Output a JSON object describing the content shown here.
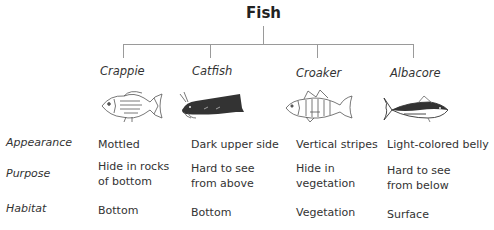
{
  "title": "Fish",
  "species": [
    {
      "name": "Crappie",
      "icon": "crappie-fish-icon"
    },
    {
      "name": "Catfish",
      "icon": "catfish-icon"
    },
    {
      "name": "Croaker",
      "icon": "croaker-fish-icon"
    },
    {
      "name": "Albacore",
      "icon": "albacore-fish-icon"
    }
  ],
  "rows": [
    {
      "label": "Appearance",
      "values": [
        "Mottled",
        "Dark upper side",
        "Vertical stripes",
        "Light-colored belly"
      ]
    },
    {
      "label": "Purpose",
      "values": [
        [
          "Hide in rocks",
          "of bottom"
        ],
        [
          "Hard to see",
          "from above"
        ],
        [
          "Hide in",
          "vegetation"
        ],
        [
          "Hard to see",
          "from below"
        ]
      ]
    },
    {
      "label": "Habitat",
      "values": [
        "Bottom",
        "Bottom",
        "Vegetation",
        "Surface"
      ]
    }
  ],
  "purpose_lines": {
    "c0": {
      "l1": "Hide in rocks",
      "l2": "of bottom"
    },
    "c1": {
      "l1": "Hard to see",
      "l2": "from above"
    },
    "c2": {
      "l1": "Hide in",
      "l2": "vegetation"
    },
    "c3": {
      "l1": "Hard to see",
      "l2": "from below"
    }
  },
  "colors": {
    "line": "#9a9a9a",
    "text": "#333333",
    "dark_fill": "#333333"
  }
}
